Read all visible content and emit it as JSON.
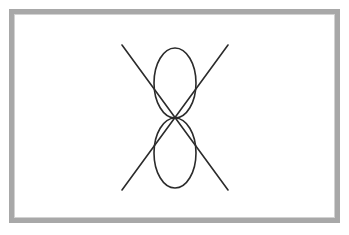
{
  "image": {
    "title": "Line drawing: X with vertical figure-eight",
    "width": 349,
    "height": 235,
    "background_color": "#ffffff"
  },
  "frame": {
    "name": "picture-frame-border",
    "color": "#a8a8a8",
    "inner_highlight_color": "#d2d2d2",
    "thickness_px": 5,
    "x": 9,
    "y": 9,
    "width": 331,
    "height": 214
  },
  "drawing": {
    "stroke_color": "#2b2b2b",
    "stroke_width": 1.6,
    "center": {
      "x": 175,
      "y": 118
    },
    "shapes": [
      {
        "name": "diagonal-line-nw-se",
        "type": "line",
        "x1": 122,
        "y1": 45,
        "x2": 228,
        "y2": 190
      },
      {
        "name": "diagonal-line-ne-sw",
        "type": "line",
        "x1": 228,
        "y1": 45,
        "x2": 122,
        "y2": 190
      },
      {
        "name": "upper-loop",
        "type": "ellipse",
        "cx": 175,
        "cy": 83,
        "rx": 21,
        "ry": 35
      },
      {
        "name": "lower-loop",
        "type": "ellipse",
        "cx": 175,
        "cy": 153,
        "rx": 21,
        "ry": 35
      }
    ]
  }
}
